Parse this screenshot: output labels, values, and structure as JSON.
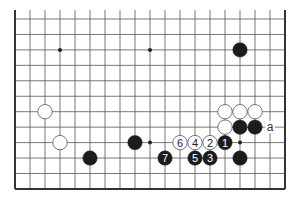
{
  "diagram": {
    "type": "go-board-fragment",
    "colors": {
      "background": "#ffffff",
      "grid": "#555555",
      "edge": "#333333",
      "black_stone": "#1c1c1c",
      "white_stone_fill": "#ffffff",
      "white_stone_stroke": "#666666",
      "black_label": "#ffffff",
      "white_label": "#222222"
    },
    "grid": {
      "columns": 19,
      "rows": 12,
      "x0": 15,
      "y0": 19,
      "dx": 15,
      "dy": 15.45,
      "top_open": true,
      "edges": [
        "left",
        "right",
        "bottom"
      ]
    },
    "star_points": [
      {
        "col": 3,
        "row": 2
      },
      {
        "col": 9,
        "row": 2
      },
      {
        "col": 9,
        "row": 8
      },
      {
        "col": 15,
        "row": 8
      }
    ],
    "stones": [
      {
        "color": "black",
        "col": 15,
        "row": 2,
        "label": ""
      },
      {
        "color": "white",
        "col": 2,
        "row": 6,
        "label": ""
      },
      {
        "color": "white",
        "col": 3,
        "row": 8,
        "label": ""
      },
      {
        "color": "black",
        "col": 5,
        "row": 9,
        "label": ""
      },
      {
        "color": "black",
        "col": 8,
        "row": 8,
        "label": ""
      },
      {
        "color": "white",
        "col": 14,
        "row": 6,
        "label": ""
      },
      {
        "color": "white",
        "col": 15,
        "row": 6,
        "label": ""
      },
      {
        "color": "white",
        "col": 16,
        "row": 6,
        "label": ""
      },
      {
        "color": "white",
        "col": 14,
        "row": 7,
        "label": ""
      },
      {
        "color": "black",
        "col": 15,
        "row": 7,
        "label": ""
      },
      {
        "color": "black",
        "col": 16,
        "row": 7,
        "label": ""
      },
      {
        "color": "black",
        "col": 14,
        "row": 8,
        "label": "1"
      },
      {
        "color": "white",
        "col": 13,
        "row": 8,
        "label": "2"
      },
      {
        "color": "black",
        "col": 13,
        "row": 9,
        "label": "3"
      },
      {
        "color": "white",
        "col": 12,
        "row": 8,
        "label": "4"
      },
      {
        "color": "black",
        "col": 12,
        "row": 9,
        "label": "5"
      },
      {
        "color": "white",
        "col": 11,
        "row": 8,
        "label": "6"
      },
      {
        "color": "black",
        "col": 10,
        "row": 9,
        "label": "7"
      },
      {
        "color": "black",
        "col": 15,
        "row": 9,
        "label": ""
      }
    ],
    "point_labels": [
      {
        "col": 17,
        "row": 7,
        "text": "a"
      }
    ]
  }
}
